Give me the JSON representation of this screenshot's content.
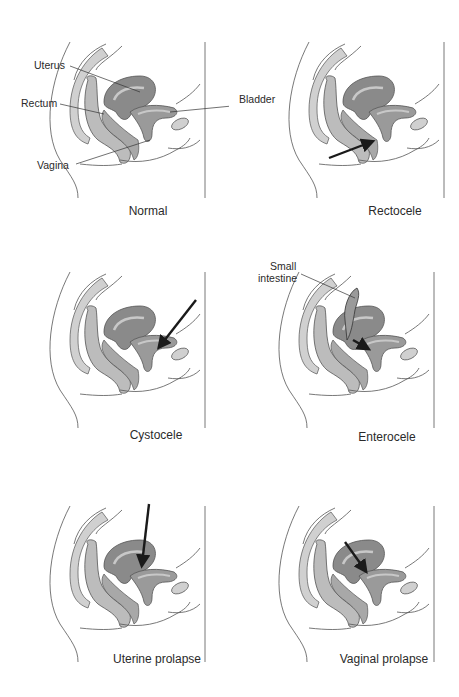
{
  "figure": {
    "panels": [
      {
        "id": "normal",
        "caption": "Normal"
      },
      {
        "id": "rectocele",
        "caption": "Rectocele"
      },
      {
        "id": "cystocele",
        "caption": "Cystocele"
      },
      {
        "id": "enterocele",
        "caption": "Enterocele"
      },
      {
        "id": "uterine-prolapse",
        "caption": "Uterine prolapse"
      },
      {
        "id": "vaginal-prolapse",
        "caption": "Vaginal prolapse"
      }
    ],
    "labels": {
      "uterus": "Uterus",
      "rectum": "Rectum",
      "vagina": "Vagina",
      "bladder": "Bladder",
      "small_intestine_1": "Small",
      "small_intestine_2": "intestine"
    },
    "colors": {
      "outline": "#555555",
      "spine": "#d0d0d0",
      "rectum": "#bcbcbc",
      "uterus": "#8a8a8a",
      "uterus_inner": "#c8c8c8",
      "bladder": "#9a9a9a",
      "arrow": "#1a1a1a"
    }
  }
}
